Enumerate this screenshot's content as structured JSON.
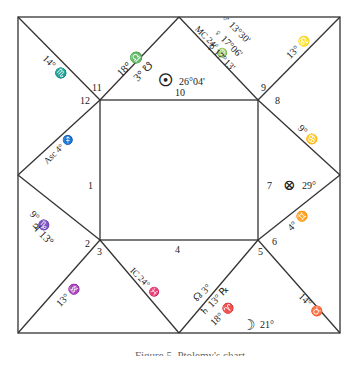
{
  "chart": {
    "type": "square horoscope chart",
    "houses": [
      {
        "number": "1",
        "cusp": "Asc 4° ♐"
      },
      {
        "number": "2",
        "cusp": "9° ♑"
      },
      {
        "number": "3",
        "cusp": "13° ♒"
      },
      {
        "number": "4",
        "cusp": "IC 24° ♓"
      },
      {
        "number": "5",
        "cusp": "18° ♈"
      },
      {
        "number": "6",
        "cusp": "14° ♉"
      },
      {
        "number": "7",
        "cusp": "4° ♊"
      },
      {
        "number": "8",
        "cusp": "9° ♋"
      },
      {
        "number": "9",
        "cusp": "13° ♌"
      },
      {
        "number": "10",
        "cusp": "MC 24° ♍"
      },
      {
        "number": "11",
        "cusp": "18° ♎"
      },
      {
        "number": "12",
        "cusp": "14° ♏"
      }
    ],
    "labels": {
      "h12_cusp": "14° ♏",
      "h11_cusp": "18° ♎",
      "h11_node": "3° ☋",
      "sun_glyph": "☉",
      "sun_pos": "26°04'",
      "mc": "MC 24° ♍",
      "mars": "♂ 13°30'",
      "venus": "♀ 17°06'",
      "mercury": "☿ 17°13'",
      "h9_cusp": "13° ♌",
      "h8_cusp": "9° ♋",
      "fortune_glyph": "⊗",
      "fortune_pos": "29°",
      "h7_cusp": "4° ♊",
      "h6_cusp": "14° ♉",
      "moon_glyph": "☽",
      "moon_pos": "21°",
      "node_h5": "☊ 3°",
      "saturn": "♄ 13° ℞",
      "h5_cusp": "18° ♈",
      "ic": "IC 24° ♓",
      "h3_cusp": "13° ♒",
      "jupiter": "♃ 13°",
      "h2_cusp": "9° ♑",
      "asc": "Asc 4° ♐"
    },
    "house_numbers": [
      "1",
      "2",
      "3",
      "4",
      "5",
      "6",
      "7",
      "8",
      "9",
      "10",
      "11",
      "12"
    ]
  },
  "caption": "Figure 5. Ptolemy's chart"
}
